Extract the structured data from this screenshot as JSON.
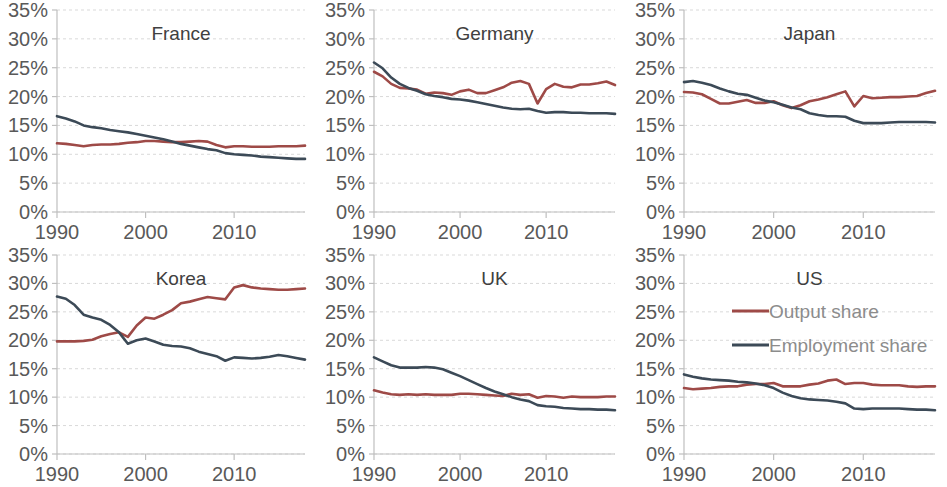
{
  "figure": {
    "panel_order": [
      "France",
      "Germany",
      "Japan",
      "Korea",
      "UK",
      "US"
    ],
    "y_tick_labels": [
      "35%",
      "30%",
      "25%",
      "20%",
      "15%",
      "10%",
      "5%",
      "0%"
    ],
    "x_tick_labels": [
      "1990",
      "2000",
      "2010"
    ],
    "legend": {
      "output_label": "Output share",
      "employment_label": "Employment share",
      "output_color": "#9E4A47",
      "employment_color": "#3C4A57"
    }
  },
  "chart_data": {
    "type": "line",
    "title": "",
    "subtitle": "",
    "xlabel": "",
    "ylabel": "",
    "xlim": [
      1990,
      2018
    ],
    "ylim": [
      0,
      35
    ],
    "y_unit": "percent",
    "yticks": [
      0,
      5,
      10,
      15,
      20,
      25,
      30,
      35
    ],
    "xticks": [
      1990,
      2000,
      2010
    ],
    "grid": true,
    "legend_position": "inside top-right of US panel",
    "legend_entries": [
      "Output share",
      "Employment share"
    ],
    "x": [
      1990,
      1991,
      1992,
      1993,
      1994,
      1995,
      1996,
      1997,
      1998,
      1999,
      2000,
      2001,
      2002,
      2003,
      2004,
      2005,
      2006,
      2007,
      2008,
      2009,
      2010,
      2011,
      2012,
      2013,
      2014,
      2015,
      2016,
      2017,
      2018
    ],
    "panels": [
      {
        "name": "France",
        "series": [
          {
            "name": "Output share",
            "color": "#9E4A47",
            "values": [
              11.9,
              11.8,
              11.6,
              11.4,
              11.6,
              11.7,
              11.7,
              11.8,
              12.0,
              12.1,
              12.3,
              12.3,
              12.2,
              12.1,
              12.1,
              12.2,
              12.3,
              12.2,
              11.6,
              11.2,
              11.4,
              11.4,
              11.3,
              11.3,
              11.3,
              11.4,
              11.4,
              11.4,
              11.5
            ]
          },
          {
            "name": "Employment share",
            "color": "#3C4A57",
            "values": [
              16.6,
              16.2,
              15.7,
              15.0,
              14.7,
              14.5,
              14.2,
              14.0,
              13.8,
              13.5,
              13.2,
              12.9,
              12.6,
              12.2,
              11.8,
              11.5,
              11.2,
              10.9,
              10.7,
              10.2,
              10.0,
              9.9,
              9.8,
              9.6,
              9.5,
              9.4,
              9.3,
              9.2,
              9.2
            ]
          }
        ]
      },
      {
        "name": "Germany",
        "series": [
          {
            "name": "Output share",
            "color": "#9E4A47",
            "values": [
              24.3,
              23.5,
              22.2,
              21.5,
              21.4,
              21.2,
              20.5,
              20.7,
              20.6,
              20.3,
              20.9,
              21.2,
              20.6,
              20.6,
              21.1,
              21.6,
              22.4,
              22.7,
              22.2,
              18.8,
              21.3,
              22.2,
              21.7,
              21.6,
              22.1,
              22.1,
              22.3,
              22.6,
              22.0
            ]
          },
          {
            "name": "Employment share",
            "color": "#3C4A57",
            "values": [
              25.9,
              24.9,
              23.3,
              22.2,
              21.5,
              21.0,
              20.4,
              20.1,
              19.9,
              19.6,
              19.5,
              19.3,
              19.0,
              18.7,
              18.4,
              18.1,
              17.9,
              17.8,
              17.9,
              17.5,
              17.2,
              17.3,
              17.3,
              17.2,
              17.2,
              17.1,
              17.1,
              17.1,
              17.0
            ]
          }
        ]
      },
      {
        "name": "Japan",
        "series": [
          {
            "name": "Output share",
            "color": "#9E4A47",
            "values": [
              20.8,
              20.7,
              20.4,
              19.6,
              18.8,
              18.8,
              19.1,
              19.4,
              18.9,
              18.9,
              19.2,
              18.5,
              18.0,
              18.5,
              19.2,
              19.5,
              19.9,
              20.4,
              20.9,
              18.3,
              20.1,
              19.7,
              19.8,
              19.9,
              19.9,
              20.0,
              20.1,
              20.6,
              21.0
            ]
          },
          {
            "name": "Employment share",
            "color": "#3C4A57",
            "values": [
              22.5,
              22.7,
              22.4,
              22.0,
              21.4,
              20.9,
              20.5,
              20.3,
              19.8,
              19.3,
              19.0,
              18.6,
              18.1,
              17.8,
              17.1,
              16.8,
              16.6,
              16.6,
              16.5,
              15.8,
              15.4,
              15.4,
              15.4,
              15.5,
              15.6,
              15.6,
              15.6,
              15.6,
              15.5
            ]
          }
        ]
      },
      {
        "name": "Korea",
        "series": [
          {
            "name": "Output share",
            "color": "#9E4A47",
            "values": [
              19.8,
              19.8,
              19.8,
              19.9,
              20.1,
              20.7,
              21.1,
              21.4,
              20.6,
              22.6,
              24.0,
              23.8,
              24.5,
              25.3,
              26.5,
              26.8,
              27.2,
              27.6,
              27.4,
              27.2,
              29.3,
              29.7,
              29.3,
              29.1,
              29.0,
              28.9,
              28.9,
              29.0,
              29.1
            ]
          },
          {
            "name": "Employment share",
            "color": "#3C4A57",
            "values": [
              27.7,
              27.3,
              26.2,
              24.5,
              24.0,
              23.6,
              22.7,
              21.4,
              19.4,
              20.0,
              20.3,
              19.8,
              19.2,
              19.0,
              18.9,
              18.6,
              18.0,
              17.6,
              17.2,
              16.4,
              17.0,
              16.9,
              16.8,
              16.9,
              17.1,
              17.4,
              17.2,
              16.9,
              16.6
            ]
          }
        ]
      },
      {
        "name": "UK",
        "series": [
          {
            "name": "Output share",
            "color": "#9E4A47",
            "values": [
              11.2,
              10.8,
              10.5,
              10.4,
              10.5,
              10.4,
              10.5,
              10.4,
              10.4,
              10.4,
              10.6,
              10.6,
              10.5,
              10.4,
              10.3,
              10.2,
              10.6,
              10.4,
              10.5,
              9.9,
              10.2,
              10.1,
              9.9,
              10.1,
              10.0,
              10.0,
              10.0,
              10.1,
              10.1
            ]
          },
          {
            "name": "Employment share",
            "color": "#3C4A57",
            "values": [
              17.0,
              16.3,
              15.6,
              15.2,
              15.2,
              15.2,
              15.3,
              15.2,
              14.9,
              14.3,
              13.7,
              13.0,
              12.3,
              11.6,
              11.0,
              10.5,
              10.0,
              9.6,
              9.3,
              8.6,
              8.4,
              8.3,
              8.1,
              8.0,
              7.9,
              7.9,
              7.8,
              7.8,
              7.7
            ]
          }
        ]
      },
      {
        "name": "US",
        "series": [
          {
            "name": "Output share",
            "color": "#9E4A47",
            "values": [
              11.6,
              11.4,
              11.5,
              11.6,
              11.8,
              11.9,
              11.9,
              12.2,
              12.3,
              12.3,
              12.5,
              11.9,
              11.9,
              11.9,
              12.2,
              12.4,
              12.9,
              13.1,
              12.3,
              12.5,
              12.5,
              12.2,
              12.1,
              12.1,
              12.1,
              11.9,
              11.8,
              11.9,
              11.9
            ]
          },
          {
            "name": "Employment share",
            "color": "#3C4A57",
            "values": [
              14.0,
              13.6,
              13.3,
              13.1,
              13.0,
              12.9,
              12.7,
              12.6,
              12.4,
              12.1,
              11.6,
              10.8,
              10.2,
              9.8,
              9.6,
              9.5,
              9.4,
              9.2,
              8.9,
              8.0,
              7.9,
              8.0,
              8.0,
              8.0,
              8.0,
              7.9,
              7.8,
              7.8,
              7.7
            ]
          }
        ]
      }
    ]
  }
}
